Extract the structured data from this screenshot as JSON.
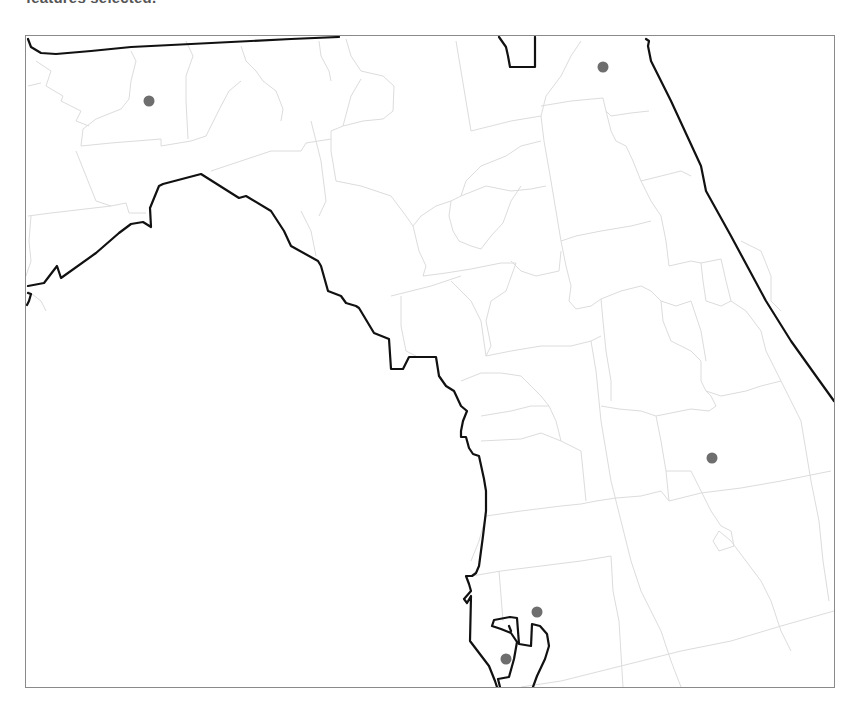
{
  "status": {
    "selection_text": "features selected."
  },
  "map": {
    "type": "county boundary map with point features",
    "colors": {
      "background": "#ffffff",
      "frame_border": "#8a8a8a",
      "county_lines": "#dcdcdc",
      "state_and_coast_lines": "#111111",
      "point_markers": "#6e6e6e"
    },
    "markers": [
      {
        "id": "point-1",
        "x": 148,
        "y": 100
      },
      {
        "id": "point-2",
        "x": 602,
        "y": 66
      },
      {
        "id": "point-3",
        "x": 711,
        "y": 457
      },
      {
        "id": "point-4",
        "x": 536,
        "y": 611
      },
      {
        "id": "point-5",
        "x": 505,
        "y": 658
      }
    ]
  }
}
